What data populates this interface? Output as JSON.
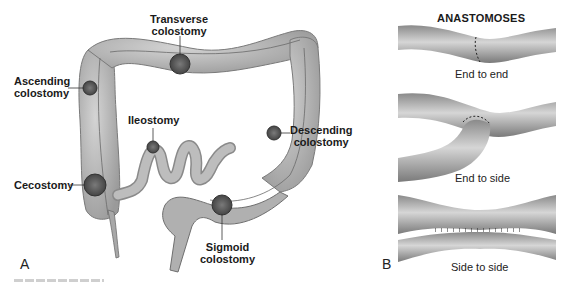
{
  "panel_a": {
    "letter": "A",
    "labels": {
      "transverse": [
        "Transverse",
        "colostomy"
      ],
      "ascending": [
        "Ascending",
        "colostomy"
      ],
      "ileostomy": "Ileostomy",
      "descending": [
        "Descending",
        "colostomy"
      ],
      "cecostomy": "Cecostomy",
      "sigmoid": [
        "Sigmoid",
        "colostomy"
      ]
    }
  },
  "panel_b": {
    "letter": "B",
    "title": "ANASTOMOSES",
    "captions": {
      "end_to_end": "End to end",
      "end_to_side": "End to side",
      "side_to_side": "Side to side"
    }
  },
  "colors": {
    "organ_fill": "#b8b8b8",
    "organ_dark": "#6e6e6e",
    "stoma": "#555555",
    "text": "#1a1a1a"
  }
}
